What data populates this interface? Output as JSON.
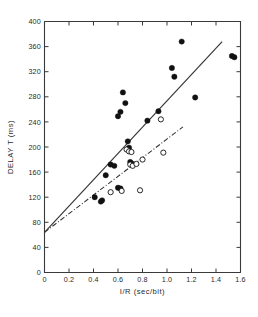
{
  "chart_data": {
    "type": "scatter",
    "title": "",
    "xlabel": "I/R  (sec/bit)",
    "ylabel": "DELAY T  (ms)",
    "xlim": [
      0,
      1.6
    ],
    "ylim": [
      0,
      400
    ],
    "grid": false,
    "legend": "none",
    "xticks": [
      "0",
      "0.2",
      "0.4",
      "0.6",
      "0.8",
      "1.0",
      "1.2",
      "1.4",
      "1.6"
    ],
    "xtick_values": [
      0,
      0.2,
      0.4,
      0.6,
      0.8,
      1.0,
      1.2,
      1.4,
      1.6
    ],
    "yticks": [
      "0",
      "40",
      "80",
      "120",
      "160",
      "200",
      "240",
      "280",
      "320",
      "360",
      "400"
    ],
    "ytick_values": [
      0,
      40,
      80,
      120,
      160,
      200,
      240,
      280,
      320,
      360,
      400
    ],
    "series": [
      {
        "name": "filled-circles",
        "marker": "filled-circle",
        "color": "#111111",
        "points": [
          [
            0.41,
            120
          ],
          [
            0.46,
            113
          ],
          [
            0.47,
            115
          ],
          [
            0.5,
            155
          ],
          [
            0.54,
            172
          ],
          [
            0.57,
            170
          ],
          [
            0.6,
            135
          ],
          [
            0.62,
            134
          ],
          [
            0.6,
            249
          ],
          [
            0.62,
            256
          ],
          [
            0.64,
            287
          ],
          [
            0.66,
            270
          ],
          [
            0.68,
            209
          ],
          [
            0.69,
            199
          ],
          [
            0.7,
            176
          ],
          [
            0.72,
            173
          ],
          [
            0.84,
            242
          ],
          [
            0.93,
            257
          ],
          [
            1.04,
            326
          ],
          [
            1.06,
            312
          ],
          [
            1.12,
            368
          ],
          [
            1.23,
            279
          ],
          [
            1.53,
            345
          ],
          [
            1.55,
            343
          ]
        ]
      },
      {
        "name": "open-circles",
        "marker": "open-circle",
        "color": "#111111",
        "points": [
          [
            0.54,
            128
          ],
          [
            0.63,
            130
          ],
          [
            0.67,
            196
          ],
          [
            0.69,
            193
          ],
          [
            0.71,
            192
          ],
          [
            0.7,
            172
          ],
          [
            0.72,
            170
          ],
          [
            0.75,
            173
          ],
          [
            0.78,
            131
          ],
          [
            0.8,
            180
          ],
          [
            0.95,
            244
          ],
          [
            0.97,
            191
          ]
        ]
      }
    ],
    "fit_lines": [
      {
        "name": "solid-regression-line",
        "style": "solid",
        "x_start": 0.0,
        "y_start": 64,
        "x_end": 1.45,
        "y_end": 368
      },
      {
        "name": "dashdot-regression-line",
        "style": "dash-dot",
        "x_start": 0.0,
        "y_start": 64,
        "x_end": 1.13,
        "y_end": 232
      }
    ]
  }
}
